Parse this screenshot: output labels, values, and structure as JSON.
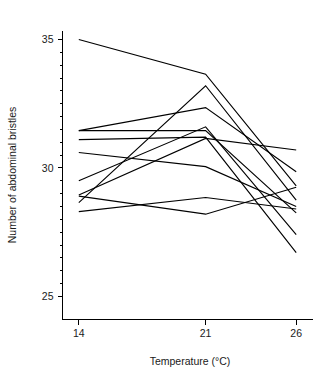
{
  "chart_data": {
    "type": "line",
    "title": "",
    "subtitle": "",
    "xlabel": "Temperature (°C)",
    "ylabel": "Number of abdominal bristles",
    "x": [
      14,
      21,
      26
    ],
    "x_tick_labels": [
      "14",
      "21",
      "26"
    ],
    "y_tick_labels": [
      "25",
      "30",
      "35"
    ],
    "y_major_ticks": [
      25,
      30,
      35
    ],
    "y_minor_ticks": [
      25.5,
      26,
      26.5,
      27,
      27.5,
      28,
      28.5,
      29,
      29.5,
      30.5,
      31,
      31.5,
      32,
      32.5,
      33,
      33.5,
      34,
      34.5
    ],
    "xlim": [
      13.1,
      26.9
    ],
    "ylim": [
      24.1,
      35.35
    ],
    "grid": false,
    "legend": false,
    "legend_position": "none",
    "line_color": "#000000",
    "background_color": "#ffffff",
    "series": [
      {
        "name": "line-1",
        "values": [
          35.0,
          33.65,
          29.3
        ]
      },
      {
        "name": "line-2",
        "values": [
          28.65,
          33.2,
          28.75
        ]
      },
      {
        "name": "line-3",
        "values": [
          31.45,
          32.35,
          29.85
        ]
      },
      {
        "name": "line-4",
        "values": [
          31.45,
          31.45,
          28.25
        ]
      },
      {
        "name": "line-5",
        "values": [
          29.5,
          31.6,
          27.4
        ]
      },
      {
        "name": "line-6",
        "values": [
          31.1,
          31.2,
          26.7
        ]
      },
      {
        "name": "line-7",
        "values": [
          28.95,
          31.15,
          30.7
        ]
      },
      {
        "name": "line-8",
        "values": [
          30.6,
          30.05,
          28.5
        ]
      },
      {
        "name": "line-9",
        "values": [
          28.9,
          28.2,
          29.25
        ]
      },
      {
        "name": "line-10",
        "values": [
          28.3,
          28.85,
          28.4
        ]
      }
    ]
  }
}
